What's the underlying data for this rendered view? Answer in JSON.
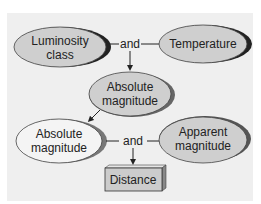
{
  "diagram": {
    "nodes": {
      "luminosity_class": {
        "line1": "Luminosity",
        "line2": "class",
        "fill": "#cfcfcf"
      },
      "temperature": {
        "label": "Temperature",
        "fill": "#cfcfcf"
      },
      "absolute_magnitude_top": {
        "line1": "Absolute",
        "line2": "magnitude",
        "fill": "#cfcfcf"
      },
      "absolute_magnitude_bottom": {
        "line1": "Absolute",
        "line2": "magnitude",
        "fill": "#f4f4f4"
      },
      "apparent_magnitude": {
        "line1": "Apparent",
        "line2": "magnitude",
        "fill": "#cfcfcf"
      },
      "distance": {
        "label": "Distance",
        "fill": "#cccccc"
      }
    },
    "connectors": {
      "and_top": "and",
      "and_bottom": "and"
    },
    "colors": {
      "panel_bg": "#efefef",
      "shadow": "#222222",
      "outline": "#444444"
    }
  }
}
